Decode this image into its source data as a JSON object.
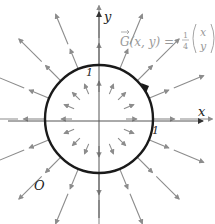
{
  "diagram": {
    "title_formula": {
      "lhs": "G(x, y) =",
      "vector_symbol": "G",
      "fraction": {
        "num": "1",
        "den": "4"
      },
      "column": [
        "x",
        "y"
      ]
    },
    "axes": {
      "x_label": "x",
      "y_label": "y",
      "origin_label": "O",
      "tick_label_y": "1",
      "tick_label_x": "1"
    },
    "curve": {
      "type": "circle",
      "radius": 1,
      "center": [
        0,
        0
      ],
      "oriented": true
    },
    "vector_field": {
      "expression": "G(x,y) = 1/4 (x, y)",
      "direction": "radial-outward",
      "rings": [
        0.5,
        1.0,
        1.5
      ],
      "directions_per_ring": 16
    },
    "colors": {
      "axis": "#555555",
      "curve": "#1a1a1a",
      "arrow": "#8c8c8c",
      "formula": "#9a9a9a"
    }
  }
}
